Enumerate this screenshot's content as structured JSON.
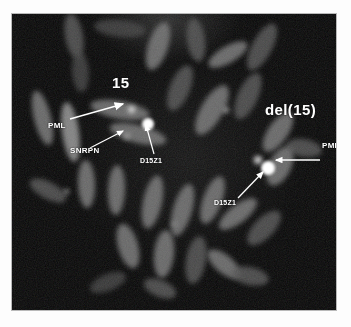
{
  "figure": {
    "type": "fish-micrograph",
    "plate_background_color": "#050505",
    "chromosome_color": "#6e6e6e",
    "signal_color": "#ffffff",
    "annotation_color": "#ffffff",
    "border_color": "#b9b9b9"
  },
  "annotations": {
    "chromosome_15_label": "15",
    "deleted_chromosome_label": "del(15)",
    "probe_pml_left": "PML",
    "probe_snrpn": "SNRPN",
    "probe_d15z1_left": "D15Z1",
    "probe_pml_right": "PML",
    "probe_d15z1_right": "D15Z1"
  },
  "probes": [
    {
      "name": "PML",
      "side": "left",
      "target": "normal chromosome 15"
    },
    {
      "name": "SNRPN",
      "side": "left",
      "target": "normal chromosome 15"
    },
    {
      "name": "D15Z1",
      "side": "left",
      "target": "normal chromosome 15"
    },
    {
      "name": "PML",
      "side": "right",
      "target": "del(15)"
    },
    {
      "name": "D15Z1",
      "side": "right",
      "target": "del(15)"
    }
  ],
  "chromosomes": [
    {
      "cx": 62,
      "cy": 22,
      "w": 18,
      "h": 46,
      "rot": -10,
      "tone": "dim"
    },
    {
      "cx": 108,
      "cy": 14,
      "w": 52,
      "h": 17,
      "rot": 6,
      "tone": "dimmer"
    },
    {
      "cx": 146,
      "cy": 32,
      "w": 20,
      "h": 50,
      "rot": 18,
      "tone": "normal"
    },
    {
      "cx": 184,
      "cy": 26,
      "w": 18,
      "h": 44,
      "rot": -8,
      "tone": "dim"
    },
    {
      "cx": 216,
      "cy": 40,
      "w": 44,
      "h": 17,
      "rot": -30,
      "tone": "normal"
    },
    {
      "cx": 250,
      "cy": 33,
      "w": 20,
      "h": 52,
      "rot": 28,
      "tone": "dim"
    },
    {
      "cx": 68,
      "cy": 58,
      "w": 17,
      "h": 40,
      "rot": -4,
      "tone": "dimmer"
    },
    {
      "cx": 30,
      "cy": 104,
      "w": 17,
      "h": 56,
      "rot": -14,
      "tone": "normal"
    },
    {
      "cx": 58,
      "cy": 118,
      "w": 17,
      "h": 60,
      "rot": -8,
      "tone": "bright"
    },
    {
      "cx": 108,
      "cy": 96,
      "w": 60,
      "h": 18,
      "rot": 10,
      "tone": "normal"
    },
    {
      "cx": 126,
      "cy": 120,
      "w": 58,
      "h": 18,
      "rot": 14,
      "tone": "normal"
    },
    {
      "cx": 168,
      "cy": 74,
      "w": 20,
      "h": 48,
      "rot": 22,
      "tone": "dim"
    },
    {
      "cx": 200,
      "cy": 96,
      "w": 22,
      "h": 56,
      "rot": 30,
      "tone": "normal"
    },
    {
      "cx": 236,
      "cy": 82,
      "w": 20,
      "h": 50,
      "rot": 24,
      "tone": "dim"
    },
    {
      "cx": 266,
      "cy": 118,
      "w": 20,
      "h": 46,
      "rot": 34,
      "tone": "normal"
    },
    {
      "cx": 292,
      "cy": 134,
      "w": 36,
      "h": 18,
      "rot": 10,
      "tone": "dim"
    },
    {
      "cx": 268,
      "cy": 152,
      "w": 22,
      "h": 42,
      "rot": 26,
      "tone": "normal"
    },
    {
      "cx": 36,
      "cy": 176,
      "w": 40,
      "h": 17,
      "rot": 28,
      "tone": "dim"
    },
    {
      "cx": 74,
      "cy": 170,
      "w": 17,
      "h": 48,
      "rot": -2,
      "tone": "normal"
    },
    {
      "cx": 104,
      "cy": 176,
      "w": 17,
      "h": 50,
      "rot": 2,
      "tone": "normal"
    },
    {
      "cx": 140,
      "cy": 188,
      "w": 19,
      "h": 54,
      "rot": 12,
      "tone": "normal"
    },
    {
      "cx": 170,
      "cy": 196,
      "w": 19,
      "h": 54,
      "rot": 16,
      "tone": "normal"
    },
    {
      "cx": 200,
      "cy": 186,
      "w": 19,
      "h": 50,
      "rot": 20,
      "tone": "normal"
    },
    {
      "cx": 226,
      "cy": 200,
      "w": 46,
      "h": 18,
      "rot": -38,
      "tone": "normal"
    },
    {
      "cx": 252,
      "cy": 214,
      "w": 20,
      "h": 44,
      "rot": 44,
      "tone": "dim"
    },
    {
      "cx": 116,
      "cy": 232,
      "w": 20,
      "h": 46,
      "rot": -16,
      "tone": "normal"
    },
    {
      "cx": 152,
      "cy": 240,
      "w": 20,
      "h": 48,
      "rot": 6,
      "tone": "normal"
    },
    {
      "cx": 184,
      "cy": 246,
      "w": 20,
      "h": 48,
      "rot": 10,
      "tone": "dim"
    },
    {
      "cx": 212,
      "cy": 250,
      "w": 40,
      "h": 18,
      "rot": 40,
      "tone": "normal"
    },
    {
      "cx": 238,
      "cy": 262,
      "w": 38,
      "h": 18,
      "rot": 12,
      "tone": "dim"
    },
    {
      "cx": 96,
      "cy": 268,
      "w": 38,
      "h": 17,
      "rot": -22,
      "tone": "dimmer"
    },
    {
      "cx": 148,
      "cy": 274,
      "w": 34,
      "h": 17,
      "rot": 22,
      "tone": "dim"
    }
  ],
  "signals": [
    {
      "probe": "D15Z1",
      "side": "left",
      "x": 136,
      "y": 110,
      "r": 6,
      "kind": "bright"
    },
    {
      "probe": "PML",
      "side": "left",
      "x": 120,
      "y": 96,
      "r": 3.5,
      "kind": "soft"
    },
    {
      "probe": "SNRPN",
      "side": "left",
      "x": 115,
      "y": 122,
      "r": 3,
      "kind": "faint"
    },
    {
      "probe": "D15Z1",
      "side": "right",
      "x": 256,
      "y": 154,
      "r": 7,
      "kind": "bright"
    },
    {
      "probe": "PML",
      "side": "right",
      "x": 246,
      "y": 146,
      "r": 4,
      "kind": "soft"
    },
    {
      "probe": "other",
      "side": "right",
      "x": 214,
      "y": 96,
      "r": 3,
      "kind": "faint"
    }
  ]
}
